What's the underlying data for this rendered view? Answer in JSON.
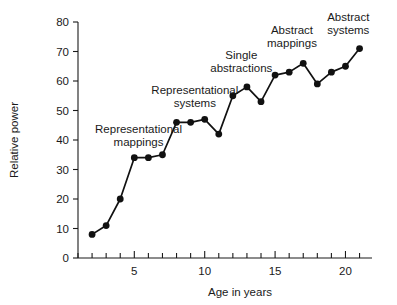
{
  "chart_data": {
    "type": "line",
    "title": "",
    "xlabel": "Age in years",
    "ylabel": "Relative power",
    "xlim": [
      1,
      21.6
    ],
    "ylim": [
      0,
      80
    ],
    "grid": false,
    "legend": null,
    "x_ticks_major": [
      5,
      10,
      15,
      20
    ],
    "x_ticks_minor": [
      1,
      2,
      3,
      4,
      6,
      7,
      8,
      9,
      11,
      12,
      13,
      14,
      16,
      17,
      18,
      19,
      21
    ],
    "y_ticks": [
      0,
      10,
      20,
      30,
      40,
      50,
      60,
      70,
      80
    ],
    "x": [
      2,
      3,
      4,
      5,
      6,
      7,
      8,
      9,
      10,
      11,
      12,
      13,
      14,
      15,
      16,
      17,
      18,
      19,
      20,
      21
    ],
    "y": [
      8,
      11,
      20,
      34,
      34,
      35,
      46,
      46,
      47,
      42,
      55,
      58,
      53,
      62,
      63,
      66,
      59,
      63,
      65,
      71
    ],
    "series": [
      {
        "name": "Relative power",
        "color": "#111111",
        "marker": "circle",
        "values": [
          8,
          11,
          20,
          34,
          34,
          35,
          46,
          46,
          47,
          42,
          55,
          58,
          53,
          62,
          63,
          66,
          59,
          63,
          65,
          71
        ]
      }
    ],
    "annotations": [
      {
        "text_line1": "Representational",
        "text_line2": "mappings",
        "x": 5.3,
        "y": 42.5
      },
      {
        "text_line1": "Representational",
        "text_line2": "systems",
        "x": 9.3,
        "y": 55.5
      },
      {
        "text_line1": "Single",
        "text_line2": "abstractions",
        "x": 12.6,
        "y": 67.5
      },
      {
        "text_line1": "Abstract",
        "text_line2": "mappings",
        "x": 16.2,
        "y": 76.0
      },
      {
        "text_line1": "Abstract",
        "text_line2": "systems",
        "x": 20.2,
        "y": 80.5
      }
    ]
  },
  "axes": {
    "y_title": "Relative power",
    "x_title": "Age in years"
  }
}
